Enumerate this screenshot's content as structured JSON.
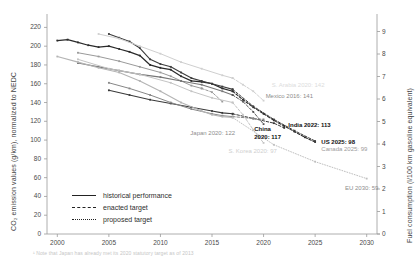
{
  "chart_data": {
    "type": "line",
    "title": "",
    "xlabel": "",
    "ylabel": "CO₂ emission values (g/km), normalized to NEDC",
    "ylabel_right": "Fuel consumption (l/100 km gasoline equivalent)",
    "xlim": [
      1999,
      2031
    ],
    "ylim": [
      0,
      230
    ],
    "ylim_right": [
      0,
      9.6
    ],
    "grid": false,
    "legend_position": "lower-left",
    "x_ticks": [
      "2000",
      "2005",
      "2010",
      "2015",
      "2020",
      "2025",
      "2030"
    ],
    "x_tick_values": [
      2000,
      2005,
      2010,
      2015,
      2020,
      2025,
      2030
    ],
    "y_ticks": [
      "0",
      "20",
      "40",
      "60",
      "80",
      "100",
      "120",
      "140",
      "160",
      "180",
      "200",
      "220"
    ],
    "y_tick_values": [
      0,
      20,
      40,
      60,
      80,
      100,
      120,
      140,
      160,
      180,
      200,
      220
    ],
    "y_ticks_right": [
      "0",
      "1",
      "2",
      "3",
      "4",
      "5",
      "6",
      "7",
      "8",
      "9"
    ],
    "y_tick_values_right": [
      0,
      1,
      2,
      3,
      4,
      5,
      6,
      7,
      8,
      9
    ],
    "legend": [
      {
        "key": "historical",
        "label": "historical performance",
        "style": "solid"
      },
      {
        "key": "enacted",
        "label": "enacted target",
        "style": "dashed"
      },
      {
        "key": "proposed",
        "label": "proposed target",
        "style": "dotted"
      }
    ],
    "annotations": [
      {
        "name": "us-2025",
        "text": "US 2025: 98",
        "x": 2025.6,
        "y": 98,
        "emphasis": "bold"
      },
      {
        "name": "canada-2025",
        "text": "Canada 2025: 99",
        "x": 2025.6,
        "y": 90,
        "emphasis": "grey"
      },
      {
        "name": "india-2022",
        "text": "India 2022: 113",
        "x": 2022.4,
        "y": 116,
        "emphasis": "bold"
      },
      {
        "name": "china-2020",
        "text": "China\n2020: 117",
        "x": 2019.1,
        "y": 112,
        "emphasis": "bold"
      },
      {
        "name": "japan-2020",
        "text": "Japan 2020: 122",
        "x": 2012.9,
        "y": 108,
        "emphasis": "mid"
      },
      {
        "name": "korea-2020",
        "text": "S. Korea 2020: 97",
        "x": 2016.6,
        "y": 88,
        "emphasis": "faint"
      },
      {
        "name": "mexico-2016",
        "text": "Mexico 2016: 141",
        "x": 2020.2,
        "y": 147,
        "emphasis": "mid"
      },
      {
        "name": "saudi-2020",
        "text": "S. Arabia 2020: 142",
        "x": 2020.8,
        "y": 159,
        "emphasis": "faint2"
      },
      {
        "name": "eu-2030",
        "text": "EU 2030: 59",
        "x": 2027.9,
        "y": 49,
        "emphasis": "mid"
      }
    ],
    "series": [
      {
        "name": "US historical",
        "style": "solid",
        "color": "#2b2b2b",
        "width": 1.25,
        "markers": true,
        "points": [
          [
            2000,
            206
          ],
          [
            2001,
            207
          ],
          [
            2002,
            204
          ],
          [
            2003,
            201
          ],
          [
            2004,
            199
          ],
          [
            2005,
            200
          ],
          [
            2006,
            197
          ],
          [
            2007,
            194
          ],
          [
            2008,
            190
          ],
          [
            2009,
            180
          ],
          [
            2010,
            177
          ],
          [
            2011,
            175
          ],
          [
            2012,
            168
          ],
          [
            2013,
            163
          ],
          [
            2014,
            162
          ],
          [
            2015,
            160
          ],
          [
            2016,
            155
          ],
          [
            2017,
            152
          ]
        ]
      },
      {
        "name": "US enacted target",
        "style": "dashed",
        "color": "#2b2b2b",
        "width": 1.1,
        "markers": true,
        "points": [
          [
            2017,
            152
          ],
          [
            2018,
            143
          ],
          [
            2019,
            135
          ],
          [
            2020,
            128
          ],
          [
            2021,
            121
          ],
          [
            2022,
            115
          ],
          [
            2023,
            109
          ],
          [
            2024,
            103
          ],
          [
            2025,
            98
          ]
        ]
      },
      {
        "name": "Canada historical",
        "style": "solid",
        "color": "#3d3d3d",
        "width": 1.1,
        "markers": true,
        "points": [
          [
            2005,
            213
          ],
          [
            2006,
            209
          ],
          [
            2007,
            205
          ],
          [
            2008,
            198
          ],
          [
            2009,
            186
          ],
          [
            2010,
            181
          ],
          [
            2011,
            178
          ],
          [
            2012,
            172
          ],
          [
            2013,
            166
          ],
          [
            2014,
            163
          ],
          [
            2015,
            160
          ],
          [
            2016,
            157
          ],
          [
            2017,
            154
          ]
        ]
      },
      {
        "name": "Canada enacted target",
        "style": "dashed",
        "color": "#3d3d3d",
        "width": 1.0,
        "markers": true,
        "points": [
          [
            2017,
            154
          ],
          [
            2019,
            136
          ],
          [
            2021,
            122
          ],
          [
            2023,
            110
          ],
          [
            2025,
            99
          ]
        ]
      },
      {
        "name": "S. Arabia historical",
        "style": "solid",
        "color": "#cfcfcf",
        "width": 1.0,
        "markers": true,
        "points": [
          [
            2004,
            213
          ],
          [
            2006,
            208
          ],
          [
            2008,
            200
          ],
          [
            2010,
            192
          ],
          [
            2012,
            183
          ],
          [
            2014,
            176
          ],
          [
            2016,
            169
          ],
          [
            2017,
            166
          ]
        ]
      },
      {
        "name": "S. Arabia enacted target",
        "style": "dashed",
        "color": "#cfcfcf",
        "width": 1.0,
        "markers": true,
        "points": [
          [
            2017,
            166
          ],
          [
            2018,
            159
          ],
          [
            2019,
            152
          ],
          [
            2020,
            142
          ]
        ]
      },
      {
        "name": "Mexico historical",
        "style": "solid",
        "color": "#9a9a9a",
        "width": 1.0,
        "markers": true,
        "points": [
          [
            2002,
            193
          ],
          [
            2004,
            189
          ],
          [
            2006,
            184
          ],
          [
            2008,
            178
          ],
          [
            2010,
            172
          ],
          [
            2011,
            168
          ],
          [
            2012,
            163
          ],
          [
            2013,
            158
          ],
          [
            2014,
            155
          ]
        ]
      },
      {
        "name": "Mexico enacted target",
        "style": "dashed",
        "color": "#9a9a9a",
        "width": 1.0,
        "markers": true,
        "points": [
          [
            2014,
            155
          ],
          [
            2015,
            151
          ],
          [
            2016,
            141
          ]
        ]
      },
      {
        "name": "China historical",
        "style": "solid",
        "color": "#777777",
        "width": 1.1,
        "markers": true,
        "points": [
          [
            2002,
            182
          ],
          [
            2004,
            178
          ],
          [
            2006,
            174
          ],
          [
            2008,
            170
          ],
          [
            2010,
            167
          ],
          [
            2012,
            163
          ],
          [
            2014,
            159
          ],
          [
            2016,
            152
          ],
          [
            2017,
            148
          ]
        ]
      },
      {
        "name": "China enacted target",
        "style": "dashed",
        "color": "#555555",
        "width": 1.0,
        "markers": true,
        "points": [
          [
            2017,
            148
          ],
          [
            2018,
            141
          ],
          [
            2019,
            130
          ],
          [
            2020,
            117
          ]
        ]
      },
      {
        "name": "India historical",
        "style": "solid",
        "color": "#3a3a3a",
        "width": 1.1,
        "markers": true,
        "points": [
          [
            2005,
            153
          ],
          [
            2007,
            148
          ],
          [
            2009,
            143
          ],
          [
            2011,
            139
          ],
          [
            2013,
            135
          ],
          [
            2015,
            131
          ],
          [
            2016,
            129
          ],
          [
            2017,
            128
          ]
        ]
      },
      {
        "name": "India enacted target",
        "style": "dashed",
        "color": "#3a3a3a",
        "width": 1.0,
        "markers": true,
        "points": [
          [
            2017,
            128
          ],
          [
            2019,
            123
          ],
          [
            2021,
            118
          ],
          [
            2022,
            113
          ]
        ]
      },
      {
        "name": "Japan historical",
        "style": "solid",
        "color": "#878787",
        "width": 1.0,
        "markers": true,
        "points": [
          [
            2005,
            161
          ],
          [
            2007,
            155
          ],
          [
            2009,
            148
          ],
          [
            2011,
            140
          ],
          [
            2013,
            133
          ],
          [
            2015,
            128
          ],
          [
            2016,
            126
          ],
          [
            2017,
            125
          ]
        ]
      },
      {
        "name": "Japan enacted target",
        "style": "dashed",
        "color": "#878787",
        "width": 1.0,
        "markers": true,
        "points": [
          [
            2017,
            125
          ],
          [
            2019,
            123
          ],
          [
            2020,
            122
          ]
        ]
      },
      {
        "name": "S. Korea historical",
        "style": "solid",
        "color": "#c4c4c4",
        "width": 1.0,
        "markers": true,
        "points": [
          [
            2002,
            186
          ],
          [
            2005,
            176
          ],
          [
            2008,
            170
          ],
          [
            2011,
            161
          ],
          [
            2013,
            152
          ],
          [
            2015,
            145
          ],
          [
            2017,
            140
          ]
        ]
      },
      {
        "name": "S. Korea enacted target",
        "style": "dashed",
        "color": "#c4c4c4",
        "width": 1.0,
        "markers": true,
        "points": [
          [
            2017,
            140
          ],
          [
            2018,
            127
          ],
          [
            2019,
            111
          ],
          [
            2020,
            97
          ]
        ]
      },
      {
        "name": "EU historical",
        "style": "solid",
        "color": "#b4b4b4",
        "width": 1.1,
        "markers": true,
        "points": [
          [
            2000,
            189
          ],
          [
            2002,
            183
          ],
          [
            2004,
            177
          ],
          [
            2006,
            172
          ],
          [
            2008,
            163
          ],
          [
            2010,
            152
          ],
          [
            2012,
            140
          ],
          [
            2014,
            131
          ],
          [
            2015,
            127
          ],
          [
            2016,
            125
          ],
          [
            2017,
            124
          ]
        ]
      },
      {
        "name": "EU proposed target",
        "style": "dotted",
        "color": "#bfbfbf",
        "width": 1.0,
        "markers": true,
        "points": [
          [
            2017,
            124
          ],
          [
            2021,
            95
          ],
          [
            2025,
            77
          ],
          [
            2030,
            59
          ]
        ]
      }
    ]
  },
  "footnote": "¹ Note that Japan has already met its 2020 statutory target as of 2013"
}
